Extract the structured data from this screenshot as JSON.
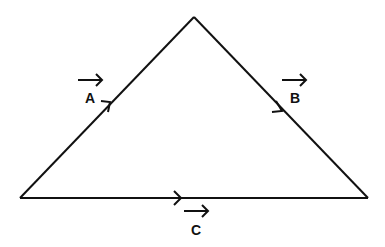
{
  "diagram": {
    "type": "vector-triangle",
    "stroke_color": "#111111",
    "background": "#ffffff",
    "vertices": {
      "top": [
        194,
        17
      ],
      "left": [
        20,
        198
      ],
      "right": [
        368,
        198
      ]
    },
    "vectors": [
      {
        "label": "A",
        "side": "left",
        "direction": "bottom-left to top"
      },
      {
        "label": "B",
        "side": "right",
        "direction": "top to bottom-right"
      },
      {
        "label": "C",
        "side": "bottom",
        "direction": "left to right"
      }
    ]
  }
}
